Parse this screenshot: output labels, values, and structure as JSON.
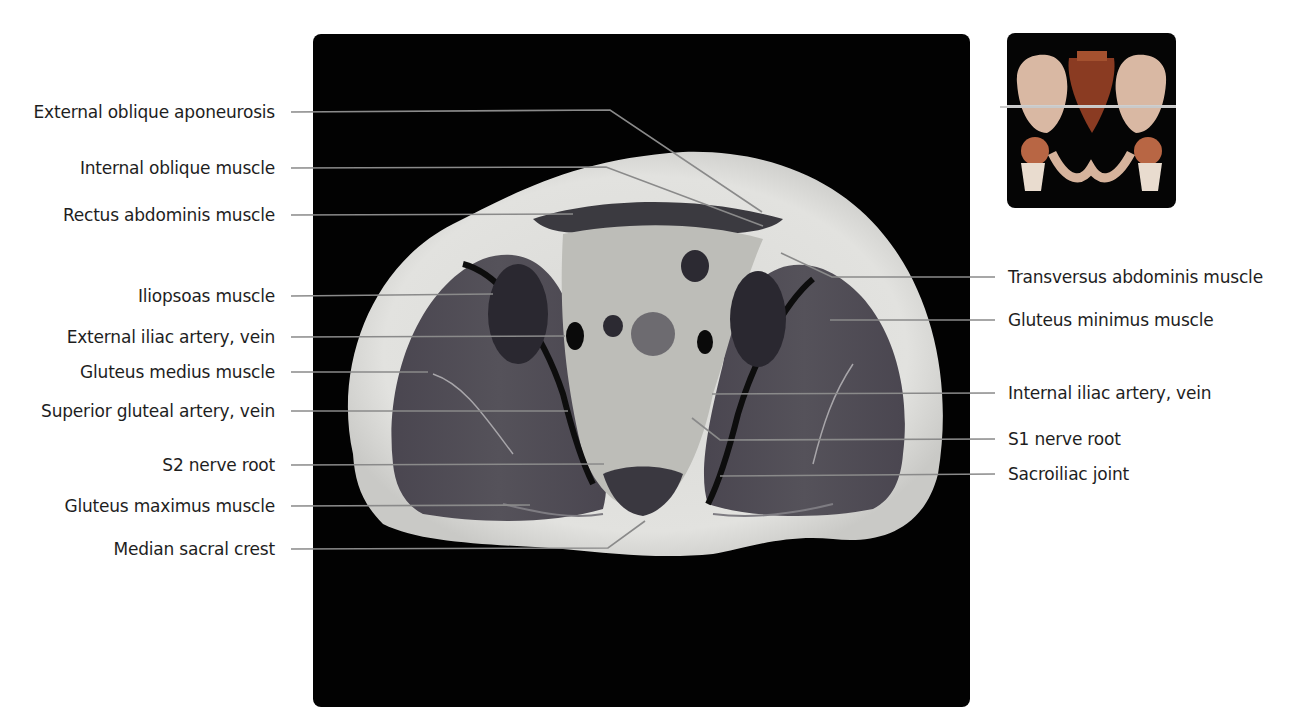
{
  "figure": {
    "main_image": "axial pelvic MRI slice (T1-weighted) through sacroiliac joints",
    "thumbnail": {
      "description": "3D volume rendering of pelvis with slice-level indicator line",
      "slice_line_y_fraction": 0.42
    }
  },
  "labels_left": [
    {
      "text": "External oblique aponeurosis",
      "y": 112
    },
    {
      "text": "Internal oblique muscle",
      "y": 168
    },
    {
      "text": "Rectus abdominis muscle",
      "y": 215
    },
    {
      "text": "Iliopsoas muscle",
      "y": 296
    },
    {
      "text": "External iliac artery, vein",
      "y": 337
    },
    {
      "text": "Gluteus medius muscle",
      "y": 372
    },
    {
      "text": "Superior gluteal artery, vein",
      "y": 411
    },
    {
      "text": "S2 nerve root",
      "y": 465
    },
    {
      "text": "Gluteus maximus muscle",
      "y": 506
    },
    {
      "text": "Median sacral crest",
      "y": 549
    }
  ],
  "labels_right": [
    {
      "text": "Transversus abdominis muscle",
      "y": 277
    },
    {
      "text": "Gluteus minimus muscle",
      "y": 320
    },
    {
      "text": "Internal iliac artery, vein",
      "y": 393
    },
    {
      "text": "S1 nerve root",
      "y": 439
    },
    {
      "text": "Sacroiliac joint",
      "y": 474
    }
  ],
  "colors": {
    "label_text": "#1e1e1e",
    "leader_line_outside": "#555555",
    "leader_line_inside": "#d8d8d8",
    "panel_background": "#020202"
  }
}
